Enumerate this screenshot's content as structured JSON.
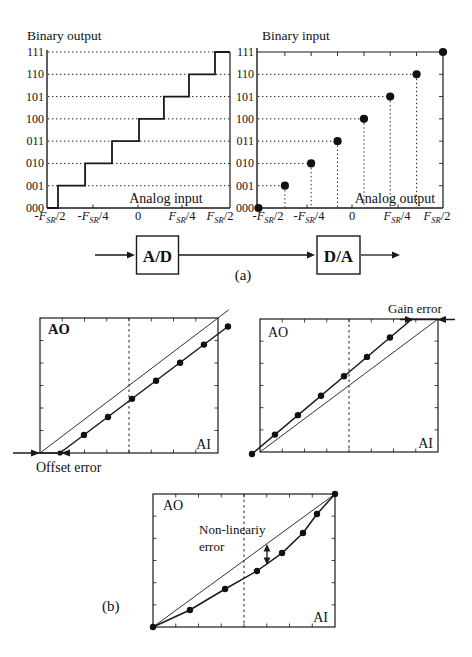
{
  "panel_a": {
    "caption": "(a)",
    "ad_block_label": "A/D",
    "da_block_label": "D/A"
  },
  "panel_b": {
    "caption": "(b)"
  },
  "chart_data": [
    {
      "id": "adc_transfer",
      "type": "step-line",
      "title": "Binary output",
      "xlabel": "Analog input",
      "x_tick_labels": [
        "-F_{SR}/2",
        "-F_{SR}/4",
        "0",
        "F_{SR}/4",
        "F_{SR}/2"
      ],
      "y_tick_labels": [
        "000",
        "001",
        "010",
        "011",
        "100",
        "101",
        "110",
        "111"
      ],
      "riser_x_fracs": [
        0.06,
        0.208,
        0.355,
        0.503,
        0.639,
        0.776,
        0.918
      ]
    },
    {
      "id": "dac_transfer",
      "type": "stem-scatter",
      "title": "Binary input",
      "xlabel": "Analog output",
      "x_tick_labels": [
        "-F_{SR}/2",
        "-F_{SR}/4",
        "0",
        "F_{SR}/4",
        "F_{SR}/2"
      ],
      "y_tick_labels": [
        "000",
        "001",
        "010",
        "011",
        "100",
        "101",
        "110",
        "111"
      ],
      "dot_x_fracs": [
        0.008,
        0.15,
        0.291,
        0.433,
        0.575,
        0.716,
        0.858,
        1.0
      ]
    },
    {
      "id": "offset_error",
      "type": "line",
      "ylabel": "AO",
      "xlabel": "AI",
      "annotation": "Offset error",
      "ideal_line_frac": [
        [
          0,
          0
        ],
        [
          1.06,
          1.06
        ]
      ],
      "actual_dots_frac": [
        [
          0.112,
          0
        ],
        [
          0.247,
          0.134
        ],
        [
          0.382,
          0.267
        ],
        [
          0.517,
          0.401
        ],
        [
          0.652,
          0.535
        ],
        [
          0.787,
          0.669
        ],
        [
          0.921,
          0.803
        ],
        [
          1.056,
          0.937
        ]
      ]
    },
    {
      "id": "gain_error",
      "type": "line",
      "ylabel": "AO",
      "xlabel": "AI",
      "annotation": "Gain error",
      "ideal_line_frac": [
        [
          0,
          0
        ],
        [
          1,
          1
        ]
      ],
      "line_end_frac": [
        0.854,
        1.0
      ],
      "actual_dots_frac": [
        [
          -0.045,
          -0.015
        ],
        [
          0.084,
          0.131
        ],
        [
          0.213,
          0.277
        ],
        [
          0.343,
          0.423
        ],
        [
          0.472,
          0.569
        ],
        [
          0.601,
          0.715
        ],
        [
          0.73,
          0.861
        ]
      ]
    },
    {
      "id": "nonlinearity_error",
      "type": "line",
      "ylabel": "AO",
      "xlabel": "AI",
      "annotation_line1": "Non-lineariy",
      "annotation_line2": "error",
      "ideal_line_frac": [
        [
          0,
          0
        ],
        [
          1,
          1
        ]
      ],
      "curve_dots_frac": [
        [
          0,
          0
        ],
        [
          0.203,
          0.128
        ],
        [
          0.396,
          0.286
        ],
        [
          0.571,
          0.421
        ],
        [
          0.709,
          0.556
        ],
        [
          0.824,
          0.707
        ],
        [
          0.901,
          0.85
        ],
        [
          1,
          1
        ]
      ]
    }
  ]
}
